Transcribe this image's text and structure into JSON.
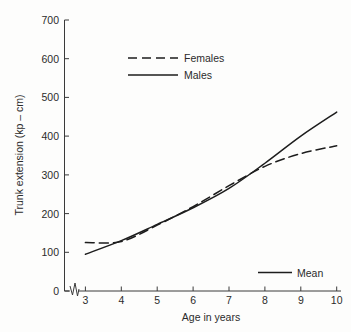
{
  "chart_data": {
    "type": "line",
    "title": "",
    "xlabel": "Age in years",
    "ylabel": "Trunk extension (kp – cm)",
    "xlim": [
      2.6,
      10.3
    ],
    "ylim": [
      0,
      700
    ],
    "grid": false,
    "axis_break": true,
    "legend_position": "upper-left-inside",
    "yticks": [
      0,
      100,
      200,
      300,
      400,
      500,
      600,
      700
    ],
    "ytick_labels": [
      "0",
      "100",
      "200",
      "300",
      "400",
      "500",
      "600",
      "700"
    ],
    "xticks": [
      3,
      4,
      5,
      6,
      7,
      8,
      9,
      10
    ],
    "xtick_labels": [
      "3",
      "4",
      "5",
      "6",
      "7",
      "8",
      "9",
      "10"
    ],
    "x": [
      3,
      4,
      5,
      6,
      7,
      8,
      9,
      10
    ],
    "series": [
      {
        "name": "Females",
        "style": "dashed",
        "color": "#1d1d1d",
        "values": [
          125,
          128,
          170,
          218,
          272,
          322,
          355,
          375
        ]
      },
      {
        "name": "Males",
        "style": "solid",
        "color": "#1d1d1d",
        "values": [
          95,
          130,
          172,
          215,
          265,
          330,
          400,
          462
        ]
      }
    ],
    "annotations": [
      {
        "name": "mean-note",
        "label": "Mean",
        "style": "solid",
        "x": 8.6,
        "y": 52
      }
    ]
  },
  "legend": {
    "entries": [
      {
        "label": "Females",
        "style": "dashed"
      },
      {
        "label": "Males",
        "style": "solid"
      }
    ]
  },
  "axes": {
    "y_title": "Trunk extension (kp – cm)",
    "x_title": "Age in years",
    "y_labels": [
      "700",
      "600",
      "500",
      "400",
      "300",
      "200",
      "100",
      "0"
    ],
    "x_labels": [
      "3",
      "4",
      "5",
      "6",
      "7",
      "8",
      "9",
      "10"
    ]
  }
}
